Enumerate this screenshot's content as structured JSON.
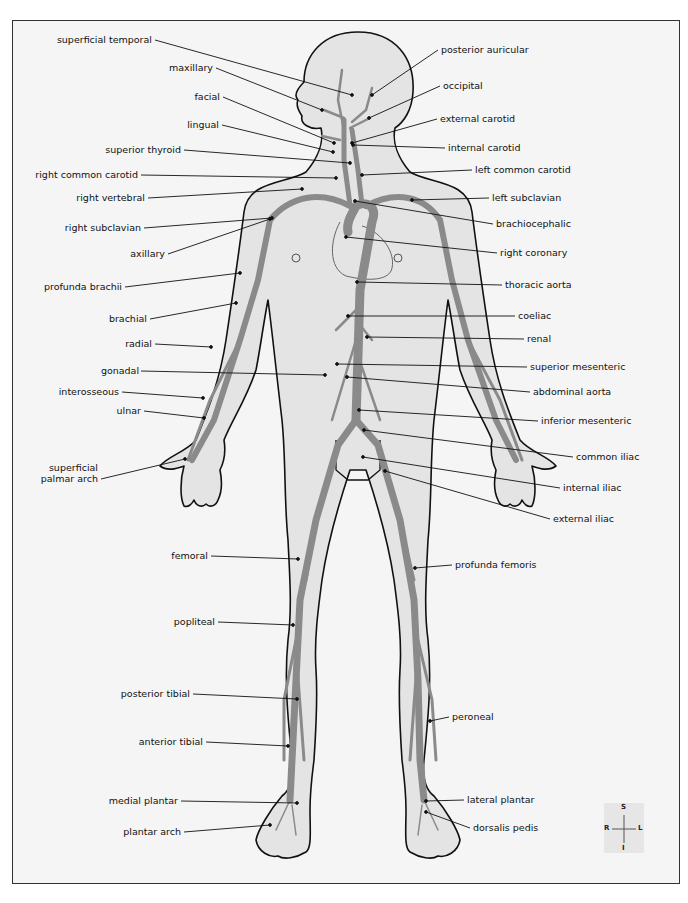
{
  "diagram": {
    "title": "",
    "colors": {
      "artery": "#8a8a8a",
      "body_fill": "#e4e4e4",
      "outline": "#111111",
      "background": "#f5f5f5",
      "frame": "#333333"
    },
    "labels_left": [
      {
        "id": "superficial-temporal",
        "text": "superficial temporal",
        "x": 152,
        "y": 40,
        "tx": 352,
        "ty": 95
      },
      {
        "id": "maxillary",
        "text": "maxillary",
        "x": 213,
        "y": 68,
        "tx": 322,
        "ty": 110
      },
      {
        "id": "facial",
        "text": "facial",
        "x": 220,
        "y": 97,
        "tx": 334,
        "ty": 143
      },
      {
        "id": "lingual",
        "text": "lingual",
        "x": 219,
        "y": 125,
        "tx": 333,
        "ty": 152
      },
      {
        "id": "superior-thyroid",
        "text": "superior thyroid",
        "x": 181,
        "y": 150,
        "tx": 350,
        "ty": 163
      },
      {
        "id": "right-common-carotid",
        "text": "right common carotid",
        "x": 138,
        "y": 175,
        "tx": 336,
        "ty": 178
      },
      {
        "id": "right-vertebral",
        "text": "right vertebral",
        "x": 145,
        "y": 198,
        "tx": 302,
        "ty": 189
      },
      {
        "id": "right-subclavian",
        "text": "right subclavian",
        "x": 141,
        "y": 228,
        "tx": 272,
        "ty": 218
      },
      {
        "id": "axillary",
        "text": "axillary",
        "x": 165,
        "y": 254,
        "tx": 270,
        "ty": 219
      },
      {
        "id": "profunda-brachii",
        "text": "profunda brachii",
        "x": 122,
        "y": 287,
        "tx": 240,
        "ty": 273
      },
      {
        "id": "brachial",
        "text": "brachial",
        "x": 147,
        "y": 319,
        "tx": 236,
        "ty": 303
      },
      {
        "id": "radial",
        "text": "radial",
        "x": 152,
        "y": 344,
        "tx": 211,
        "ty": 347
      },
      {
        "id": "gonadal",
        "text": "gonadal",
        "x": 138,
        "y": 371,
        "tx": 325,
        "ty": 375
      },
      {
        "id": "interosseous",
        "text": "interosseous",
        "x": 119,
        "y": 392,
        "tx": 203,
        "ty": 398
      },
      {
        "id": "ulnar",
        "text": "ulnar",
        "x": 141,
        "y": 411,
        "tx": 204,
        "ty": 418
      },
      {
        "id": "superficial-palmar-arch",
        "text": "superficial\npalmar arch",
        "x": 98,
        "y": 479,
        "tx": 185,
        "ty": 459
      },
      {
        "id": "femoral",
        "text": "femoral",
        "x": 208,
        "y": 556,
        "tx": 298,
        "ty": 559
      },
      {
        "id": "popliteal",
        "text": "popliteal",
        "x": 215,
        "y": 622,
        "tx": 293,
        "ty": 625
      },
      {
        "id": "posterior-tibial",
        "text": "posterior tibial",
        "x": 190,
        "y": 694,
        "tx": 297,
        "ty": 699
      },
      {
        "id": "anterior-tibial",
        "text": "anterior tibial",
        "x": 203,
        "y": 742,
        "tx": 288,
        "ty": 746
      },
      {
        "id": "medial-plantar",
        "text": "medial plantar",
        "x": 178,
        "y": 801,
        "tx": 297,
        "ty": 803
      },
      {
        "id": "plantar-arch",
        "text": "plantar arch",
        "x": 181,
        "y": 832,
        "tx": 270,
        "ty": 825
      }
    ],
    "labels_right": [
      {
        "id": "posterior-auricular",
        "text": "posterior auricular",
        "x": 441,
        "y": 50,
        "tx": 372,
        "ty": 95
      },
      {
        "id": "occipital",
        "text": "occipital",
        "x": 443,
        "y": 86,
        "tx": 369,
        "ty": 118
      },
      {
        "id": "external-carotid",
        "text": "external carotid",
        "x": 440,
        "y": 119,
        "tx": 352,
        "ty": 143
      },
      {
        "id": "internal-carotid",
        "text": "internal carotid",
        "x": 448,
        "y": 148,
        "tx": 353,
        "ty": 145
      },
      {
        "id": "left-common-carotid",
        "text": "left common carotid",
        "x": 475,
        "y": 170,
        "tx": 362,
        "ty": 175
      },
      {
        "id": "left-subclavian",
        "text": "left subclavian",
        "x": 492,
        "y": 198,
        "tx": 412,
        "ty": 200
      },
      {
        "id": "brachiocephalic",
        "text": "brachiocephalic",
        "x": 496,
        "y": 224,
        "tx": 355,
        "ty": 201
      },
      {
        "id": "right-coronary",
        "text": "right coronary",
        "x": 500,
        "y": 253,
        "tx": 346,
        "ty": 237
      },
      {
        "id": "thoracic-aorta",
        "text": "thoracic aorta",
        "x": 505,
        "y": 285,
        "tx": 357,
        "ty": 282
      },
      {
        "id": "coeliac",
        "text": "coeliac",
        "x": 518,
        "y": 316,
        "tx": 348,
        "ty": 316
      },
      {
        "id": "renal",
        "text": "renal",
        "x": 527,
        "y": 339,
        "tx": 367,
        "ty": 337
      },
      {
        "id": "superior-mesenteric",
        "text": "superior mesenteric",
        "x": 530,
        "y": 367,
        "tx": 337,
        "ty": 364
      },
      {
        "id": "abdominal-aorta",
        "text": "abdominal aorta",
        "x": 533,
        "y": 392,
        "tx": 347,
        "ty": 377
      },
      {
        "id": "inferior-mesenteric",
        "text": "inferior mesenteric",
        "x": 541,
        "y": 421,
        "tx": 359,
        "ty": 410
      },
      {
        "id": "common-iliac",
        "text": "common iliac",
        "x": 576,
        "y": 457,
        "tx": 364,
        "ty": 430
      },
      {
        "id": "internal-iliac",
        "text": "internal iliac",
        "x": 563,
        "y": 488,
        "tx": 363,
        "ty": 457
      },
      {
        "id": "external-iliac",
        "text": "external iliac",
        "x": 553,
        "y": 519,
        "tx": 385,
        "ty": 471
      },
      {
        "id": "profunda-femoris",
        "text": "profunda femoris",
        "x": 455,
        "y": 565,
        "tx": 415,
        "ty": 568
      },
      {
        "id": "peroneal",
        "text": "peroneal",
        "x": 452,
        "y": 717,
        "tx": 430,
        "ty": 721
      },
      {
        "id": "lateral-plantar",
        "text": "lateral plantar",
        "x": 467,
        "y": 800,
        "tx": 426,
        "ty": 801
      },
      {
        "id": "dorsalis-pedis",
        "text": "dorsalis pedis",
        "x": 473,
        "y": 828,
        "tx": 426,
        "ty": 812
      }
    ],
    "compass": {
      "superior": "S",
      "inferior": "I",
      "right": "R",
      "left": "L"
    }
  }
}
